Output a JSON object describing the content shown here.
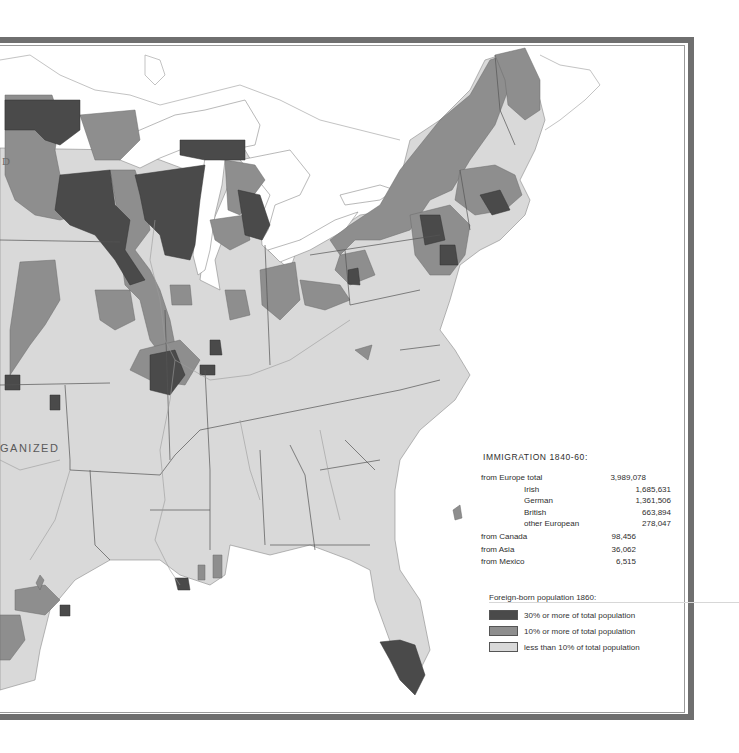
{
  "map": {
    "region": "Eastern United States",
    "labels": {
      "unorganized": "GANIZED",
      "partial_d": "D"
    },
    "colors": {
      "water": "#ffffff",
      "land_low": "#d9d9d9",
      "land_mid": "#8e8e8e",
      "land_high": "#4a4a4a",
      "boundary": "#555555",
      "frame": "#6f6f6f"
    }
  },
  "immigration": {
    "title": "IMMIGRATION 1840-60:",
    "europe_total": {
      "label": "from Europe total",
      "value": "3,989,078"
    },
    "europe_breakdown": [
      {
        "label": "Irish",
        "value": "1,685,631"
      },
      {
        "label": "German",
        "value": "1,361,506"
      },
      {
        "label": "British",
        "value": "663,894"
      },
      {
        "label": "other European",
        "value": "278,047"
      }
    ],
    "other_sources": [
      {
        "label": "from Canada",
        "value": "98,456"
      },
      {
        "label": "from Asia",
        "value": "36,062"
      },
      {
        "label": "from Mexico",
        "value": "6,515"
      }
    ]
  },
  "legend": {
    "title": "Foreign-born population 1860:",
    "items": [
      {
        "label": "30% or more of total population",
        "color": "#4a4a4a"
      },
      {
        "label": "10% or more of total population",
        "color": "#8e8e8e"
      },
      {
        "label": "less than 10% of total population",
        "color": "#d9d9d9"
      }
    ]
  }
}
